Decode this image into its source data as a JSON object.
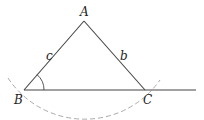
{
  "diagram": {
    "type": "geometry-triangle",
    "vertices": {
      "A": {
        "label": "A",
        "x": 84,
        "y": 21
      },
      "B": {
        "label": "B",
        "x": 24,
        "y": 90
      },
      "C": {
        "label": "C",
        "x": 145,
        "y": 90
      }
    },
    "sides": {
      "c": {
        "label": "c",
        "between": [
          "A",
          "B"
        ]
      },
      "b": {
        "label": "b",
        "between": [
          "A",
          "C"
        ]
      }
    },
    "baseline": {
      "from": "B",
      "extends_to_x": 196
    },
    "angle_mark": {
      "at": "B",
      "label": ""
    },
    "dashed_arc": {
      "center": "A",
      "through": [
        "B",
        "C"
      ],
      "color": "#aaaaaa"
    },
    "colors": {
      "line": "#444444",
      "arc": "#aaaaaa",
      "text": "#222222"
    }
  }
}
